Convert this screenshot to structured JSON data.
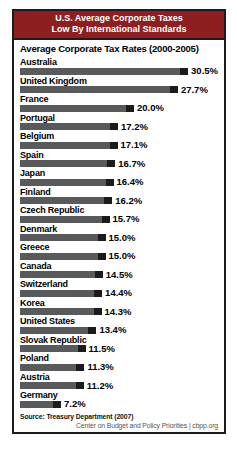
{
  "header": {
    "title_line1": "U.S. Average Corporate Taxes",
    "title_line2": "Low By International Standards",
    "bg_color": "#8d1f21",
    "text_color": "#ffffff"
  },
  "subtitle": "Average Corporate Tax Rates (2000-2005)",
  "chart_data": {
    "type": "bar",
    "orientation": "horizontal",
    "title": "U.S. Average Corporate Taxes Low By International Standards",
    "subtitle": "Average Corporate Tax Rates (2000-2005)",
    "categories": [
      "Australia",
      "United Kingdom",
      "France",
      "Portugal",
      "Belgium",
      "Spain",
      "Japan",
      "Finland",
      "Czech Republic",
      "Denmark",
      "Greece",
      "Canada",
      "Switzerland",
      "Korea",
      "United States",
      "Slovak Republic",
      "Poland",
      "Austria",
      "Germany"
    ],
    "values": [
      30.5,
      27.7,
      20.0,
      17.2,
      17.1,
      16.7,
      16.4,
      16.2,
      15.7,
      15.0,
      15.0,
      14.5,
      14.4,
      14.3,
      13.4,
      11.5,
      11.3,
      11.2,
      7.2
    ],
    "value_labels": [
      "30.5%",
      "27.7%",
      "20.0%",
      "17.2%",
      "17.1%",
      "16.7%",
      "16.4%",
      "16.2%",
      "15.7%",
      "15.0%",
      "15.0%",
      "14.5%",
      "14.4%",
      "14.3%",
      "13.4%",
      "11.5%",
      "11.3%",
      "11.2%",
      "7.2%"
    ],
    "xlim": [
      0,
      31
    ],
    "grid": false,
    "legend": "none",
    "bar_color": "#595a5c",
    "bar_cap_color": "#1b1b1d"
  },
  "footer": {
    "source": "Source: Treasury Department (2007)",
    "credit": "Center on Budget and Policy Priorities | cbpp.org"
  }
}
